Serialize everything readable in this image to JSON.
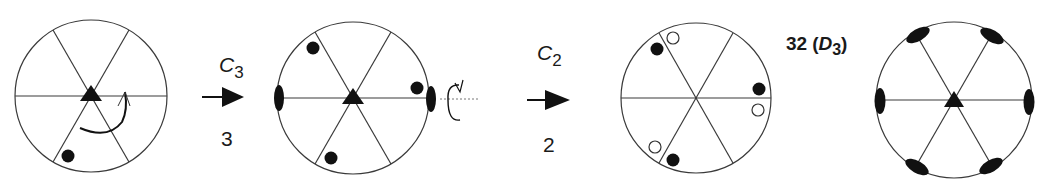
{
  "diagram": {
    "title_label": "32",
    "title_group_open": "(",
    "title_group_symbol": "D",
    "title_group_subscript": "3",
    "title_group_close": ")",
    "steps": [
      {
        "operator_symbol": "C",
        "operator_subscript": "3",
        "order_label": "3"
      },
      {
        "operator_symbol": "C",
        "operator_subscript": "2",
        "order_label": "2"
      }
    ],
    "stereograms": [
      {
        "id": "start",
        "description": "single point with threefold axis and rotation arrow"
      },
      {
        "id": "after-c3",
        "description": "three points with twofold axis added"
      },
      {
        "id": "after-c2",
        "description": "six points, filled and open"
      },
      {
        "id": "final-d3",
        "description": "point group 32 symmetry elements"
      }
    ],
    "colors": {
      "line": "#3a3a3a",
      "fill": "#111111",
      "axis_dotted": "#777777"
    }
  }
}
